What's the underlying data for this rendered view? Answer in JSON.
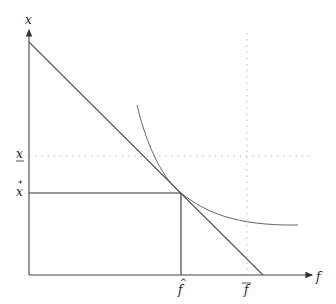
{
  "diagram": {
    "type": "economics-optimization",
    "axes": {
      "x_label": "f",
      "y_label": "x"
    },
    "tick_labels": {
      "x_star": "x̂",
      "x_lower": "x",
      "f_star": "f̂",
      "f_bar": "f̄"
    },
    "elements": [
      {
        "name": "budget-line",
        "kind": "straight line",
        "from": [
          29,
          42
        ],
        "to": [
          263,
          275
        ]
      },
      {
        "name": "indifference-curve",
        "kind": "convex curve tangent to budget line at (f̂, x̂)"
      },
      {
        "name": "x-hat-guide",
        "kind": "solid horizontal line at x̂ up to f̂"
      },
      {
        "name": "f-hat-guide",
        "kind": "solid vertical line at f̂ down to axis"
      },
      {
        "name": "x-lower-guide",
        "kind": "dotted horizontal line at x (underlined)"
      },
      {
        "name": "f-bar-guide",
        "kind": "dotted vertical line at f̄"
      }
    ],
    "colors": {
      "axis": "#444444",
      "line": "#555555",
      "dotted": "#aaaaaa"
    }
  }
}
